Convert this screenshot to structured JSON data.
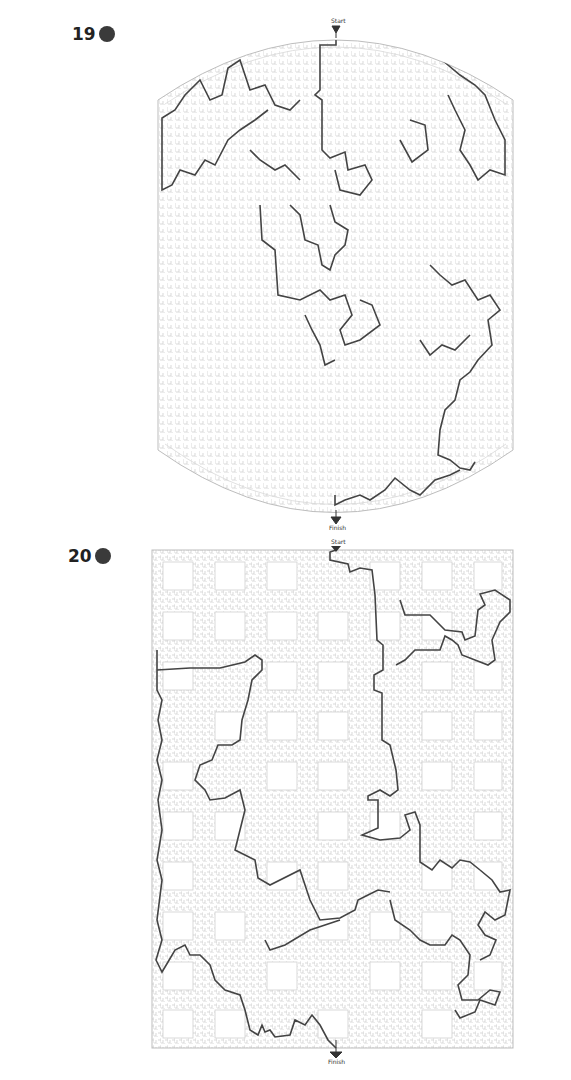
{
  "puzzles": [
    {
      "number": "19",
      "shape": "barrel",
      "start_label": "Start",
      "finish_label": "Finish",
      "wall_color": "#c8c8c8",
      "path_color": "#444444"
    },
    {
      "number": "20",
      "shape": "rectangle-with-blocks",
      "start_label": "Start",
      "finish_label": "Finish",
      "wall_color": "#c8c8c8",
      "path_color": "#444444"
    }
  ],
  "colors": {
    "background": "#ffffff",
    "marker_dot": "#3a3a3a",
    "number_text": "#222222"
  }
}
